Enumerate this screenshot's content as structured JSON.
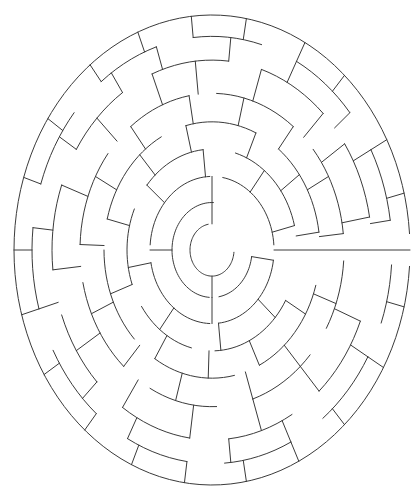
{
  "document": {
    "title": "Circular Maze",
    "type": "radial-maze-puzzle",
    "background_color": "#ffffff",
    "line_color": "#3a3a3a",
    "line_width": 1,
    "canvas": {
      "width": 419,
      "height": 496
    }
  },
  "maze": {
    "center": {
      "x": 212,
      "y": 250
    },
    "shape": "ellipse",
    "radius_x": 198,
    "radius_y": 235,
    "ring_count": 8,
    "ring_radii": [
      22,
      40,
      62,
      85,
      108,
      132,
      160,
      180,
      198
    ],
    "sector_count": 48,
    "entrance": {
      "name": "outer-entrance",
      "side": "right",
      "angle_deg": 0,
      "description": "horizontal opening at right edge"
    },
    "goal": {
      "name": "center-goal",
      "description": "innermost circular chamber"
    },
    "arcs": [
      {
        "ring": 0,
        "start_deg": 100,
        "end_deg": 355
      },
      {
        "ring": 1,
        "start_deg": 88,
        "end_deg": 266
      },
      {
        "ring": 1,
        "start_deg": 280,
        "end_deg": 352
      },
      {
        "ring": 2,
        "start_deg": 92,
        "end_deg": 176
      },
      {
        "ring": 2,
        "start_deg": 190,
        "end_deg": 268
      },
      {
        "ring": 2,
        "start_deg": 276,
        "end_deg": 352
      },
      {
        "ring": 2,
        "start_deg": 4,
        "end_deg": 80
      },
      {
        "ring": 3,
        "start_deg": 14,
        "end_deg": 74
      },
      {
        "ring": 3,
        "start_deg": 96,
        "end_deg": 140
      },
      {
        "ring": 3,
        "start_deg": 156,
        "end_deg": 200
      },
      {
        "ring": 3,
        "start_deg": 214,
        "end_deg": 256
      },
      {
        "ring": 3,
        "start_deg": 272,
        "end_deg": 330
      },
      {
        "ring": 4,
        "start_deg": 8,
        "end_deg": 52
      },
      {
        "ring": 4,
        "start_deg": 66,
        "end_deg": 104
      },
      {
        "ring": 4,
        "start_deg": 118,
        "end_deg": 166
      },
      {
        "ring": 4,
        "start_deg": 180,
        "end_deg": 224
      },
      {
        "ring": 4,
        "start_deg": 238,
        "end_deg": 282
      },
      {
        "ring": 4,
        "start_deg": 296,
        "end_deg": 344
      },
      {
        "ring": 5,
        "start_deg": 6,
        "end_deg": 40
      },
      {
        "ring": 5,
        "start_deg": 52,
        "end_deg": 88
      },
      {
        "ring": 5,
        "start_deg": 100,
        "end_deg": 128
      },
      {
        "ring": 5,
        "start_deg": 142,
        "end_deg": 178
      },
      {
        "ring": 5,
        "start_deg": 192,
        "end_deg": 228
      },
      {
        "ring": 5,
        "start_deg": 242,
        "end_deg": 272
      },
      {
        "ring": 5,
        "start_deg": 288,
        "end_deg": 318
      },
      {
        "ring": 5,
        "start_deg": 330,
        "end_deg": 356
      },
      {
        "ring": 6,
        "start_deg": 10,
        "end_deg": 34
      },
      {
        "ring": 6,
        "start_deg": 46,
        "end_deg": 72
      },
      {
        "ring": 6,
        "start_deg": 84,
        "end_deg": 112
      },
      {
        "ring": 6,
        "start_deg": 124,
        "end_deg": 148
      },
      {
        "ring": 6,
        "start_deg": 160,
        "end_deg": 186
      },
      {
        "ring": 6,
        "start_deg": 200,
        "end_deg": 224
      },
      {
        "ring": 6,
        "start_deg": 236,
        "end_deg": 262
      },
      {
        "ring": 6,
        "start_deg": 276,
        "end_deg": 300
      },
      {
        "ring": 6,
        "start_deg": 312,
        "end_deg": 338
      },
      {
        "ring": 7,
        "start_deg": 8,
        "end_deg": 28
      },
      {
        "ring": 7,
        "start_deg": 40,
        "end_deg": 62
      },
      {
        "ring": 7,
        "start_deg": 74,
        "end_deg": 96
      },
      {
        "ring": 7,
        "start_deg": 108,
        "end_deg": 128
      },
      {
        "ring": 7,
        "start_deg": 140,
        "end_deg": 162
      },
      {
        "ring": 7,
        "start_deg": 174,
        "end_deg": 196
      },
      {
        "ring": 7,
        "start_deg": 208,
        "end_deg": 230
      },
      {
        "ring": 7,
        "start_deg": 242,
        "end_deg": 262
      },
      {
        "ring": 7,
        "start_deg": 274,
        "end_deg": 296
      },
      {
        "ring": 7,
        "start_deg": 308,
        "end_deg": 330
      },
      {
        "ring": 7,
        "start_deg": 340,
        "end_deg": 356
      }
    ],
    "spokes": [
      {
        "ring_from": 0,
        "ring_to": 1,
        "angle_deg": 90
      },
      {
        "ring_from": 0,
        "ring_to": 1,
        "angle_deg": 270
      },
      {
        "ring_from": 1,
        "ring_to": 2,
        "angle_deg": 90
      },
      {
        "ring_from": 1,
        "ring_to": 2,
        "angle_deg": 180
      },
      {
        "ring_from": 1,
        "ring_to": 2,
        "angle_deg": 270
      },
      {
        "ring_from": 1,
        "ring_to": 2,
        "angle_deg": 352
      },
      {
        "ring_from": 2,
        "ring_to": 3,
        "angle_deg": 14
      },
      {
        "ring_from": 2,
        "ring_to": 3,
        "angle_deg": 52
      },
      {
        "ring_from": 2,
        "ring_to": 3,
        "angle_deg": 96
      },
      {
        "ring_from": 2,
        "ring_to": 3,
        "angle_deg": 140
      },
      {
        "ring_from": 2,
        "ring_to": 3,
        "angle_deg": 190
      },
      {
        "ring_from": 2,
        "ring_to": 3,
        "angle_deg": 232
      },
      {
        "ring_from": 2,
        "ring_to": 3,
        "angle_deg": 276
      },
      {
        "ring_from": 2,
        "ring_to": 3,
        "angle_deg": 318
      },
      {
        "ring_from": 3,
        "ring_to": 4,
        "angle_deg": 8
      },
      {
        "ring_from": 3,
        "ring_to": 4,
        "angle_deg": 36
      },
      {
        "ring_from": 3,
        "ring_to": 4,
        "angle_deg": 66
      },
      {
        "ring_from": 3,
        "ring_to": 4,
        "angle_deg": 104
      },
      {
        "ring_from": 3,
        "ring_to": 4,
        "angle_deg": 132
      },
      {
        "ring_from": 3,
        "ring_to": 4,
        "angle_deg": 166
      },
      {
        "ring_from": 3,
        "ring_to": 4,
        "angle_deg": 200
      },
      {
        "ring_from": 3,
        "ring_to": 4,
        "angle_deg": 238
      },
      {
        "ring_from": 3,
        "ring_to": 4,
        "angle_deg": 268
      },
      {
        "ring_from": 3,
        "ring_to": 4,
        "angle_deg": 296
      },
      {
        "ring_from": 3,
        "ring_to": 4,
        "angle_deg": 330
      },
      {
        "ring_from": 4,
        "ring_to": 5,
        "angle_deg": 6
      },
      {
        "ring_from": 4,
        "ring_to": 5,
        "angle_deg": 28
      },
      {
        "ring_from": 4,
        "ring_to": 5,
        "angle_deg": 52
      },
      {
        "ring_from": 4,
        "ring_to": 5,
        "angle_deg": 76
      },
      {
        "ring_from": 4,
        "ring_to": 5,
        "angle_deg": 100
      },
      {
        "ring_from": 4,
        "ring_to": 5,
        "angle_deg": 128
      },
      {
        "ring_from": 4,
        "ring_to": 5,
        "angle_deg": 152
      },
      {
        "ring_from": 4,
        "ring_to": 5,
        "angle_deg": 178
      },
      {
        "ring_from": 4,
        "ring_to": 5,
        "angle_deg": 204
      },
      {
        "ring_from": 4,
        "ring_to": 5,
        "angle_deg": 228
      },
      {
        "ring_from": 4,
        "ring_to": 5,
        "angle_deg": 254
      },
      {
        "ring_from": 4,
        "ring_to": 5,
        "angle_deg": 288
      },
      {
        "ring_from": 4,
        "ring_to": 5,
        "angle_deg": 312
      },
      {
        "ring_from": 4,
        "ring_to": 5,
        "angle_deg": 340
      },
      {
        "ring_from": 5,
        "ring_to": 6,
        "angle_deg": 10
      },
      {
        "ring_from": 5,
        "ring_to": 6,
        "angle_deg": 34
      },
      {
        "ring_from": 5,
        "ring_to": 6,
        "angle_deg": 46
      },
      {
        "ring_from": 5,
        "ring_to": 6,
        "angle_deg": 72
      },
      {
        "ring_from": 5,
        "ring_to": 6,
        "angle_deg": 96
      },
      {
        "ring_from": 5,
        "ring_to": 6,
        "angle_deg": 112
      },
      {
        "ring_from": 5,
        "ring_to": 6,
        "angle_deg": 136
      },
      {
        "ring_from": 5,
        "ring_to": 6,
        "angle_deg": 160
      },
      {
        "ring_from": 5,
        "ring_to": 6,
        "angle_deg": 186
      },
      {
        "ring_from": 5,
        "ring_to": 6,
        "angle_deg": 212
      },
      {
        "ring_from": 5,
        "ring_to": 6,
        "angle_deg": 236
      },
      {
        "ring_from": 5,
        "ring_to": 6,
        "angle_deg": 262
      },
      {
        "ring_from": 5,
        "ring_to": 6,
        "angle_deg": 288
      },
      {
        "ring_from": 5,
        "ring_to": 6,
        "angle_deg": 312
      },
      {
        "ring_from": 5,
        "ring_to": 6,
        "angle_deg": 338
      },
      {
        "ring_from": 6,
        "ring_to": 7,
        "angle_deg": 8
      },
      {
        "ring_from": 6,
        "ring_to": 7,
        "angle_deg": 28
      },
      {
        "ring_from": 6,
        "ring_to": 7,
        "angle_deg": 40
      },
      {
        "ring_from": 6,
        "ring_to": 7,
        "angle_deg": 62
      },
      {
        "ring_from": 6,
        "ring_to": 7,
        "angle_deg": 84
      },
      {
        "ring_from": 6,
        "ring_to": 7,
        "angle_deg": 108
      },
      {
        "ring_from": 6,
        "ring_to": 7,
        "angle_deg": 124
      },
      {
        "ring_from": 6,
        "ring_to": 7,
        "angle_deg": 148
      },
      {
        "ring_from": 6,
        "ring_to": 7,
        "angle_deg": 174
      },
      {
        "ring_from": 6,
        "ring_to": 7,
        "angle_deg": 196
      },
      {
        "ring_from": 6,
        "ring_to": 7,
        "angle_deg": 224
      },
      {
        "ring_from": 6,
        "ring_to": 7,
        "angle_deg": 242
      },
      {
        "ring_from": 6,
        "ring_to": 7,
        "angle_deg": 276
      },
      {
        "ring_from": 6,
        "ring_to": 7,
        "angle_deg": 296
      },
      {
        "ring_from": 6,
        "ring_to": 7,
        "angle_deg": 330
      },
      {
        "ring_from": 7,
        "ring_to": 8,
        "angle_deg": 14
      },
      {
        "ring_from": 7,
        "ring_to": 8,
        "angle_deg": 28
      },
      {
        "ring_from": 7,
        "ring_to": 8,
        "angle_deg": 48
      },
      {
        "ring_from": 7,
        "ring_to": 8,
        "angle_deg": 62
      },
      {
        "ring_from": 7,
        "ring_to": 8,
        "angle_deg": 80
      },
      {
        "ring_from": 7,
        "ring_to": 8,
        "angle_deg": 96
      },
      {
        "ring_from": 7,
        "ring_to": 8,
        "angle_deg": 112
      },
      {
        "ring_from": 7,
        "ring_to": 8,
        "angle_deg": 128
      },
      {
        "ring_from": 7,
        "ring_to": 8,
        "angle_deg": 146
      },
      {
        "ring_from": 7,
        "ring_to": 8,
        "angle_deg": 162
      },
      {
        "ring_from": 7,
        "ring_to": 8,
        "angle_deg": 180
      },
      {
        "ring_from": 7,
        "ring_to": 8,
        "angle_deg": 196
      },
      {
        "ring_from": 7,
        "ring_to": 8,
        "angle_deg": 212
      },
      {
        "ring_from": 7,
        "ring_to": 8,
        "angle_deg": 230
      },
      {
        "ring_from": 7,
        "ring_to": 8,
        "angle_deg": 246
      },
      {
        "ring_from": 7,
        "ring_to": 8,
        "angle_deg": 262
      },
      {
        "ring_from": 7,
        "ring_to": 8,
        "angle_deg": 280
      },
      {
        "ring_from": 7,
        "ring_to": 8,
        "angle_deg": 296
      },
      {
        "ring_from": 7,
        "ring_to": 8,
        "angle_deg": 312
      },
      {
        "ring_from": 7,
        "ring_to": 8,
        "angle_deg": 330
      },
      {
        "ring_from": 7,
        "ring_to": 8,
        "angle_deg": 346
      }
    ],
    "outer_boundary_gaps": [
      {
        "start_deg": 356,
        "end_deg": 4
      }
    ]
  }
}
